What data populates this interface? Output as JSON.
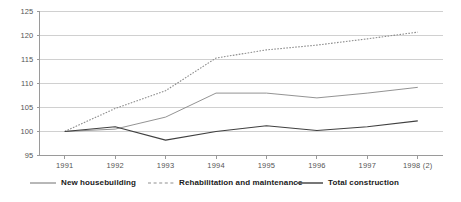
{
  "chart_data": {
    "type": "line",
    "title": "",
    "subtitle": "",
    "xlabel": "",
    "ylabel": "",
    "x": [
      "1991",
      "1992",
      "1993",
      "1994",
      "1995",
      "1996",
      "1997",
      "1998 (2)"
    ],
    "categories": [
      "1991",
      "1992",
      "1993",
      "1994",
      "1995",
      "1996",
      "1997",
      "1998 (2)"
    ],
    "ylim": [
      95,
      125
    ],
    "yticks": [
      95,
      100,
      105,
      110,
      115,
      120,
      125
    ],
    "ytick_labels": [
      "95",
      "100",
      "105",
      "110",
      "115",
      "120",
      "125"
    ],
    "grid": true,
    "grid_axis": "y",
    "legend_position": "bottom",
    "series": [
      {
        "name": "New housebuilding",
        "style": "solid-thin",
        "color": "#808080",
        "values": [
          100,
          100.5,
          103,
          108,
          108,
          107,
          108,
          109.2
        ]
      },
      {
        "name": "Rehabilitation and maintenance",
        "style": "dotted",
        "color": "#8c8c8c",
        "values": [
          100,
          104.8,
          108.5,
          115.3,
          117,
          118,
          119.3,
          120.7
        ]
      },
      {
        "name": "Total construction",
        "style": "solid-thick",
        "color": "#404040",
        "values": [
          100,
          101,
          98.2,
          100,
          101.2,
          100.2,
          101,
          102.2
        ]
      }
    ]
  },
  "legend": {
    "items": [
      {
        "label": "New housebuilding"
      },
      {
        "label": "Rehabilitation and maintenance"
      },
      {
        "label": "Total construction"
      }
    ]
  },
  "colors": {
    "axis": "#9a9a9a",
    "grid": "#d0d0d0",
    "text": "#555555",
    "legend_text": "#1a1a1a",
    "background": "#ffffff"
  }
}
